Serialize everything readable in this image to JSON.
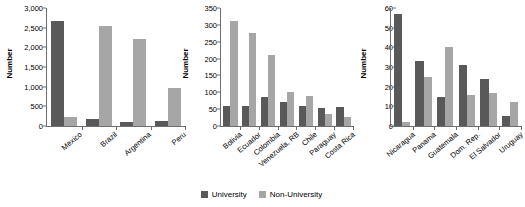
{
  "legend": {
    "position": "bottom-center",
    "items": [
      {
        "label": "University",
        "color": "#595959",
        "name": "university"
      },
      {
        "label": "Non-University",
        "color": "#a6a6a6",
        "name": "non-university"
      }
    ]
  },
  "chart_data": [
    {
      "type": "bar",
      "title": "",
      "xlabel": "",
      "ylabel": "Number",
      "ylim": [
        0,
        3000
      ],
      "yticks": [
        0,
        500,
        1000,
        1500,
        2000,
        2500,
        3000
      ],
      "ytick_labels": [
        "0",
        "500",
        "1,000",
        "1,500",
        "2,000",
        "2,500",
        "3,000"
      ],
      "grid": false,
      "categories": [
        "Mexico",
        "Brazil",
        "Argentina",
        "Peru"
      ],
      "series": [
        {
          "name": "University",
          "color": "#595959",
          "values": [
            2670,
            180,
            110,
            120
          ]
        },
        {
          "name": "Non-University",
          "color": "#a6a6a6",
          "values": [
            220,
            2540,
            2220,
            975
          ]
        }
      ]
    },
    {
      "type": "bar",
      "title": "",
      "xlabel": "",
      "ylabel": "Number",
      "ylim": [
        0,
        350
      ],
      "yticks": [
        0,
        50,
        100,
        150,
        200,
        250,
        300,
        350
      ],
      "ytick_labels": [
        "0",
        "50",
        "100",
        "150",
        "200",
        "250",
        "300",
        "350"
      ],
      "grid": false,
      "categories": [
        "Bolivia",
        "Ecuador",
        "Colombia",
        "Venezuela, RB",
        "Chile",
        "Paraguay",
        "Costa Rica"
      ],
      "series": [
        {
          "name": "University",
          "color": "#595959",
          "values": [
            58,
            58,
            86,
            71,
            59,
            52,
            57
          ]
        },
        {
          "name": "Non-University",
          "color": "#a6a6a6",
          "values": [
            312,
            276,
            212,
            101,
            90,
            37,
            28
          ]
        }
      ]
    },
    {
      "type": "bar",
      "title": "",
      "xlabel": "",
      "ylabel": "Number",
      "ylim": [
        0,
        60
      ],
      "yticks": [
        0,
        10,
        20,
        30,
        40,
        50,
        60
      ],
      "ytick_labels": [
        "0",
        "10",
        "20",
        "30",
        "40",
        "50",
        "60"
      ],
      "grid": false,
      "categories": [
        "Nicaragua",
        "Panama",
        "Guatemala",
        "Dom. Rep.",
        "El Salvador",
        "Uruguay"
      ],
      "series": [
        {
          "name": "University",
          "color": "#595959",
          "values": [
            57,
            33,
            15,
            31,
            24,
            5
          ]
        },
        {
          "name": "Non-University",
          "color": "#a6a6a6",
          "values": [
            2,
            25,
            40,
            16,
            17,
            12
          ]
        }
      ]
    }
  ]
}
